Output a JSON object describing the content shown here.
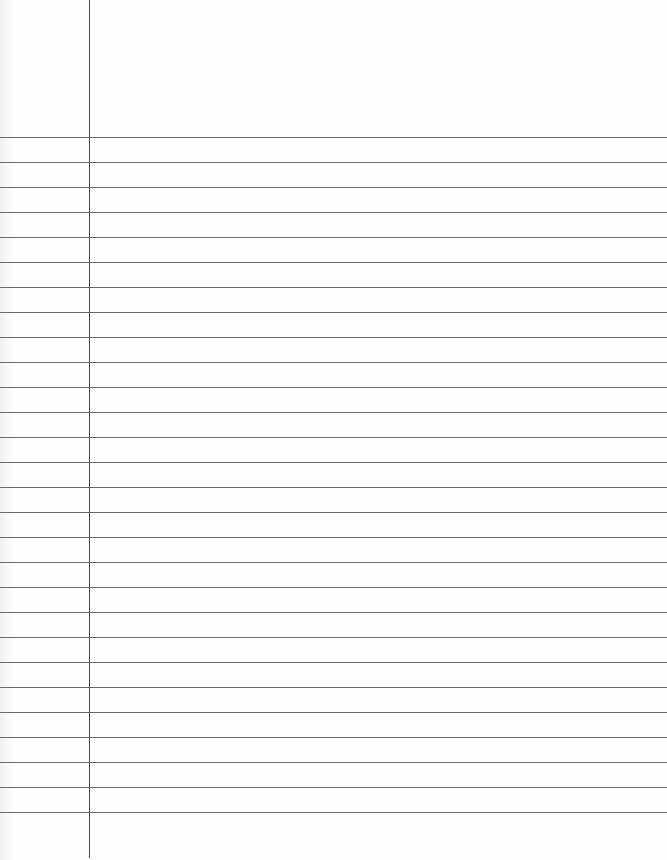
{
  "paper": {
    "type": "lined-notebook-paper",
    "background": "#fefefe",
    "line_color": "#6a6a6a",
    "margin_color": "#4a4a4a",
    "margin_x": 89,
    "first_line_y": 137,
    "line_spacing": 25,
    "line_count": 28
  }
}
